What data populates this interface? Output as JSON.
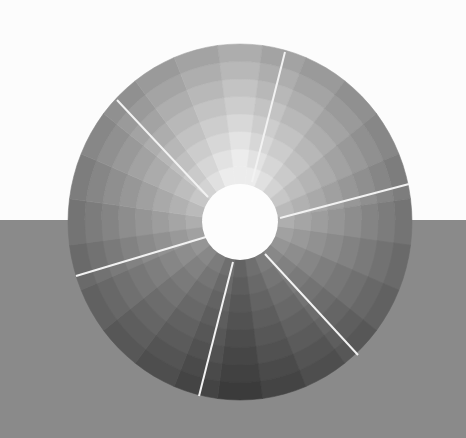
{
  "scene": {
    "title": "Grayscale value wheel",
    "background_top_color": "#fcfcfc",
    "background_bottom_color": "#8a8a8a",
    "horizon_y": 220
  },
  "wheel": {
    "center": [
      240,
      222
    ],
    "radius_x": 172,
    "radius_y": 178,
    "inner_radius": 38,
    "inner_color": "#fdfdfd",
    "rings": 8,
    "wedges": 24,
    "lightest_angle_deg": -90,
    "lightest_value": 236,
    "darkest_value": 56,
    "divider_color": "#f2f2f2",
    "divider_width": 2,
    "dividers": [
      {
        "from": [
          252,
          182
        ],
        "to": [
          285,
          52
        ]
      },
      {
        "from": [
          208,
          197
        ],
        "to": [
          117,
          100
        ]
      },
      {
        "from": [
          280,
          218
        ],
        "to": [
          409,
          184
        ]
      },
      {
        "from": [
          206,
          237
        ],
        "to": [
          76,
          276
        ]
      },
      {
        "from": [
          233,
          262
        ],
        "to": [
          199,
          396
        ]
      },
      {
        "from": [
          265,
          254
        ],
        "to": [
          358,
          355
        ]
      }
    ]
  }
}
